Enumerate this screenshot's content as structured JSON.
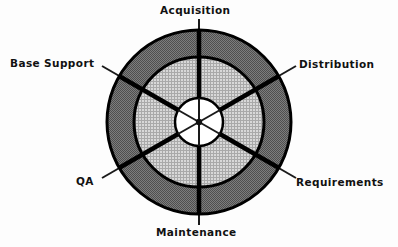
{
  "diagram": {
    "type": "concentric-ring-sector-wheel",
    "center": {
      "x": 199,
      "y": 122
    },
    "rings": [
      {
        "name": "outer-ring",
        "fill_hex": "#6e6e6e",
        "pattern": "dense-checker-dither",
        "outer_radius": 92,
        "inner_radius": 65
      },
      {
        "name": "middle-ring",
        "fill_hex": "#c2c2c2",
        "pattern": "fine-crosshatch",
        "outer_radius": 65,
        "inner_radius": 24
      },
      {
        "name": "inner-hub",
        "fill_hex": "#ffffff",
        "pattern": "solid",
        "outer_radius": 24,
        "inner_radius": 0
      }
    ],
    "stroke_hex": "#000000",
    "sector_count": 6,
    "sectors": [
      {
        "id": "acquisition",
        "label": "Acquisition",
        "angle_deg": 90,
        "leader_side": "top"
      },
      {
        "id": "distribution",
        "label": "Distribution",
        "angle_deg": 30,
        "leader_side": "upper-right"
      },
      {
        "id": "requirements",
        "label": "Requirements",
        "angle_deg": 330,
        "leader_side": "lower-right"
      },
      {
        "id": "maintenance",
        "label": "Maintenance",
        "angle_deg": 270,
        "leader_side": "bottom"
      },
      {
        "id": "qa",
        "label": "QA",
        "angle_deg": 210,
        "leader_side": "lower-left"
      },
      {
        "id": "base_support",
        "label": "Base Support",
        "angle_deg": 150,
        "leader_side": "upper-left"
      }
    ],
    "background_hex": "#fdfdfd"
  }
}
